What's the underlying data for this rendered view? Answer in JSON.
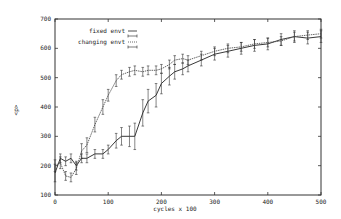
{
  "chart_data": {
    "type": "line",
    "title": "",
    "xlabel": "cycles x 100",
    "ylabel": "<p>",
    "xlim": [
      0,
      500
    ],
    "ylim": [
      100,
      700
    ],
    "xticks": [
      0,
      100,
      200,
      300,
      400,
      500
    ],
    "yticks": [
      100,
      200,
      300,
      400,
      500,
      600,
      700
    ],
    "grid": false,
    "legend_position": "upper-left-inside",
    "error_bars": true,
    "x": [
      0,
      10,
      20,
      30,
      40,
      50,
      60,
      75,
      90,
      100,
      115,
      125,
      140,
      150,
      165,
      175,
      190,
      200,
      215,
      225,
      240,
      250,
      275,
      300,
      325,
      350,
      375,
      400,
      425,
      450,
      475,
      500
    ],
    "series": [
      {
        "name": "fixed envt",
        "style": "solid",
        "values": [
          175,
          225,
          215,
          225,
          200,
          225,
          225,
          240,
          240,
          255,
          285,
          300,
          300,
          300,
          380,
          420,
          440,
          480,
          505,
          520,
          530,
          540,
          560,
          580,
          590,
          600,
          610,
          615,
          630,
          640,
          635,
          640
        ],
        "error": [
          30,
          15,
          15,
          15,
          15,
          15,
          15,
          15,
          15,
          15,
          25,
          30,
          35,
          45,
          45,
          40,
          40,
          35,
          30,
          25,
          20,
          20,
          20,
          20,
          20,
          20,
          20,
          20,
          20,
          20,
          20,
          20
        ]
      },
      {
        "name": "changing envt",
        "style": "dotted",
        "values": [
          200,
          210,
          165,
          160,
          190,
          250,
          270,
          340,
          400,
          440,
          490,
          510,
          520,
          525,
          520,
          525,
          525,
          530,
          545,
          560,
          565,
          560,
          575,
          590,
          600,
          605,
          615,
          620,
          625,
          640,
          645,
          650
        ],
        "error": [
          20,
          20,
          15,
          15,
          20,
          25,
          25,
          25,
          25,
          20,
          20,
          15,
          15,
          15,
          15,
          15,
          15,
          15,
          15,
          15,
          15,
          15,
          15,
          15,
          15,
          15,
          15,
          15,
          15,
          15,
          15,
          15
        ]
      }
    ]
  },
  "axes": {
    "xlabel": "cycles x 100",
    "ylabel": "<p>",
    "xtick_labels": [
      "0",
      "100",
      "200",
      "300",
      "400",
      "500"
    ],
    "ytick_labels": [
      "100",
      "200",
      "300",
      "400",
      "500",
      "600",
      "700"
    ]
  },
  "legend": {
    "entries": [
      {
        "label": "fixed envt",
        "style": "solid"
      },
      {
        "label": "changing envt",
        "style": "dotted"
      }
    ]
  }
}
